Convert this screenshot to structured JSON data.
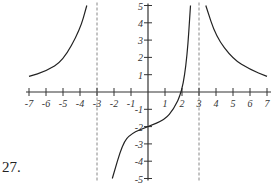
{
  "problem": {
    "number_label": "27."
  },
  "colors": {
    "curve": "#222222",
    "axis": "#333333",
    "asymptote": "#888888",
    "text": "#333333"
  },
  "chart_data": {
    "type": "line",
    "title": "",
    "xlabel": "",
    "ylabel": "",
    "xlim": [
      -7,
      7
    ],
    "ylim": [
      -5,
      5
    ],
    "grid": false,
    "legend": null,
    "x_ticks": [
      -7,
      -6,
      -5,
      -4,
      -3,
      -2,
      -1,
      1,
      2,
      3,
      4,
      5,
      6,
      7
    ],
    "y_ticks": [
      -5,
      -4,
      -3,
      -2,
      -1,
      1,
      2,
      3,
      4,
      5
    ],
    "asymptotes": {
      "vertical": [
        -3,
        3
      ],
      "horizontal": [
        0
      ]
    },
    "annotations": [
      {
        "kind": "x-intercept",
        "x": 2,
        "y": 0
      },
      {
        "kind": "y-intercept",
        "x": 0,
        "y": -2
      }
    ],
    "series": [
      {
        "name": "left branch",
        "points": [
          [
            -7,
            0.9
          ],
          [
            -6,
            1.2
          ],
          [
            -5,
            1.8
          ],
          [
            -4,
            3.6
          ],
          [
            -3.6,
            5
          ]
        ]
      },
      {
        "name": "middle branch",
        "points": [
          [
            -2.1,
            -5
          ],
          [
            -1.5,
            -3
          ],
          [
            -1,
            -2.4
          ],
          [
            0,
            -2
          ],
          [
            1,
            -1.6
          ],
          [
            1.5,
            -1.0
          ],
          [
            2,
            0
          ],
          [
            2.3,
            2
          ],
          [
            2.5,
            5
          ]
        ]
      },
      {
        "name": "right branch",
        "points": [
          [
            3.4,
            5
          ],
          [
            4,
            3.2
          ],
          [
            5,
            1.9
          ],
          [
            6,
            1.3
          ],
          [
            7,
            0.9
          ]
        ]
      }
    ]
  }
}
